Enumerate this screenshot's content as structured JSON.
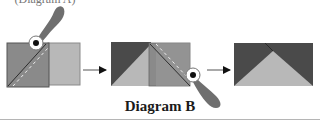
{
  "top_text": "(Diagram A)",
  "caption": "Diagram B",
  "colors": {
    "dark_fabric": "#4a4a4a",
    "mid_fabric": "#8a8a8a",
    "light_fabric": "#b8b8b8",
    "cutter_handle": "#6f6f6f",
    "outline": "#555555"
  },
  "steps": [
    {
      "id": 1,
      "description": "Stitched squares with diagonal seam, cutter trimming"
    },
    {
      "id": 2,
      "description": "Second square placed on right, diagonal stitched, cutter trimming"
    },
    {
      "id": 3,
      "description": "Finished flying geese unit"
    }
  ]
}
